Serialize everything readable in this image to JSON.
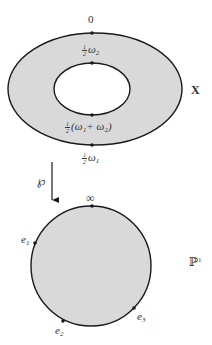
{
  "diagram": {
    "colors": {
      "fill": "#d9d9d9",
      "stroke": "#1a1a1a",
      "hole": "#ffffff"
    },
    "torus": {
      "label": "X",
      "outer_ellipse": {
        "cx": 95,
        "cy": 89,
        "rx": 87,
        "ry": 56
      },
      "inner_ellipse": {
        "cx": 92,
        "cy": 89,
        "rx": 38,
        "ry": 26
      },
      "points": [
        {
          "name": "0",
          "label": "0"
        },
        {
          "name": "half-omega2",
          "frac": "1/2",
          "text": "ω",
          "sub": "2"
        },
        {
          "name": "half-omega1-plus-omega2",
          "frac": "1/2",
          "text": "(ω₁+ ω₂)"
        },
        {
          "name": "half-omega1",
          "frac": "1/2",
          "text": "ω",
          "sub": "1"
        }
      ]
    },
    "map": {
      "label": "℘"
    },
    "sphere": {
      "label": "ℙ",
      "label_sup": "1",
      "circle": {
        "cx": 91,
        "cy": 266,
        "r": 60
      },
      "points": [
        {
          "name": "infinity",
          "label": "∞"
        },
        {
          "name": "e1",
          "label": "e",
          "sub": "1"
        },
        {
          "name": "e2",
          "label": "e",
          "sub": "2"
        },
        {
          "name": "e3",
          "label": "e",
          "sub": "3"
        }
      ]
    }
  }
}
